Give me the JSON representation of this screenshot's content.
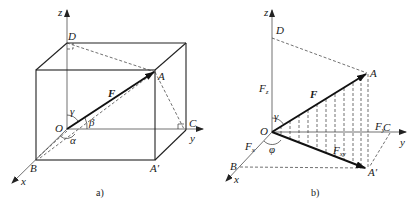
{
  "figure_a": {
    "caption": "a)",
    "labels": {
      "z": "z",
      "y": "y",
      "x": "x",
      "O": "O",
      "A": "A",
      "A_prime": "A′",
      "B": "B",
      "C": "C",
      "D": "D",
      "F": "F",
      "alpha": "α",
      "beta": "β",
      "gamma": "γ"
    }
  },
  "figure_b": {
    "caption": "b)",
    "labels": {
      "z": "z",
      "y": "y",
      "x": "x",
      "O": "O",
      "A": "A",
      "A_prime": "A′",
      "B": "B",
      "C": "C",
      "D": "D",
      "F": "F",
      "Fz": "F",
      "Fz_sub": "z",
      "Fy": "F",
      "Fy_sub": "y",
      "Fx": "F",
      "Fx_sub": "x",
      "Fxy": "F",
      "Fxy_sub": "xy",
      "gamma": "γ",
      "phi": "φ"
    }
  }
}
